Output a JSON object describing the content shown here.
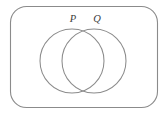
{
  "figure": {
    "kind": "venn-diagram",
    "background_color": "#ffffff",
    "stroke_color": "#8b8b8b",
    "label_color": "#3d3d3d"
  },
  "universe": {
    "name": "universal-set-rectangle",
    "x": 10.5,
    "y": 6.5,
    "width": 147,
    "height": 101,
    "corner_radius": 16
  },
  "sets": [
    {
      "id": "P",
      "label": "P",
      "circle": {
        "cx": 72,
        "cy": 61,
        "r": 32
      },
      "label_position": {
        "x": 73,
        "y": 22
      }
    },
    {
      "id": "Q",
      "label": "Q",
      "circle": {
        "cx": 94,
        "cy": 61,
        "r": 32
      },
      "label_position": {
        "x": 97,
        "y": 22
      }
    }
  ]
}
